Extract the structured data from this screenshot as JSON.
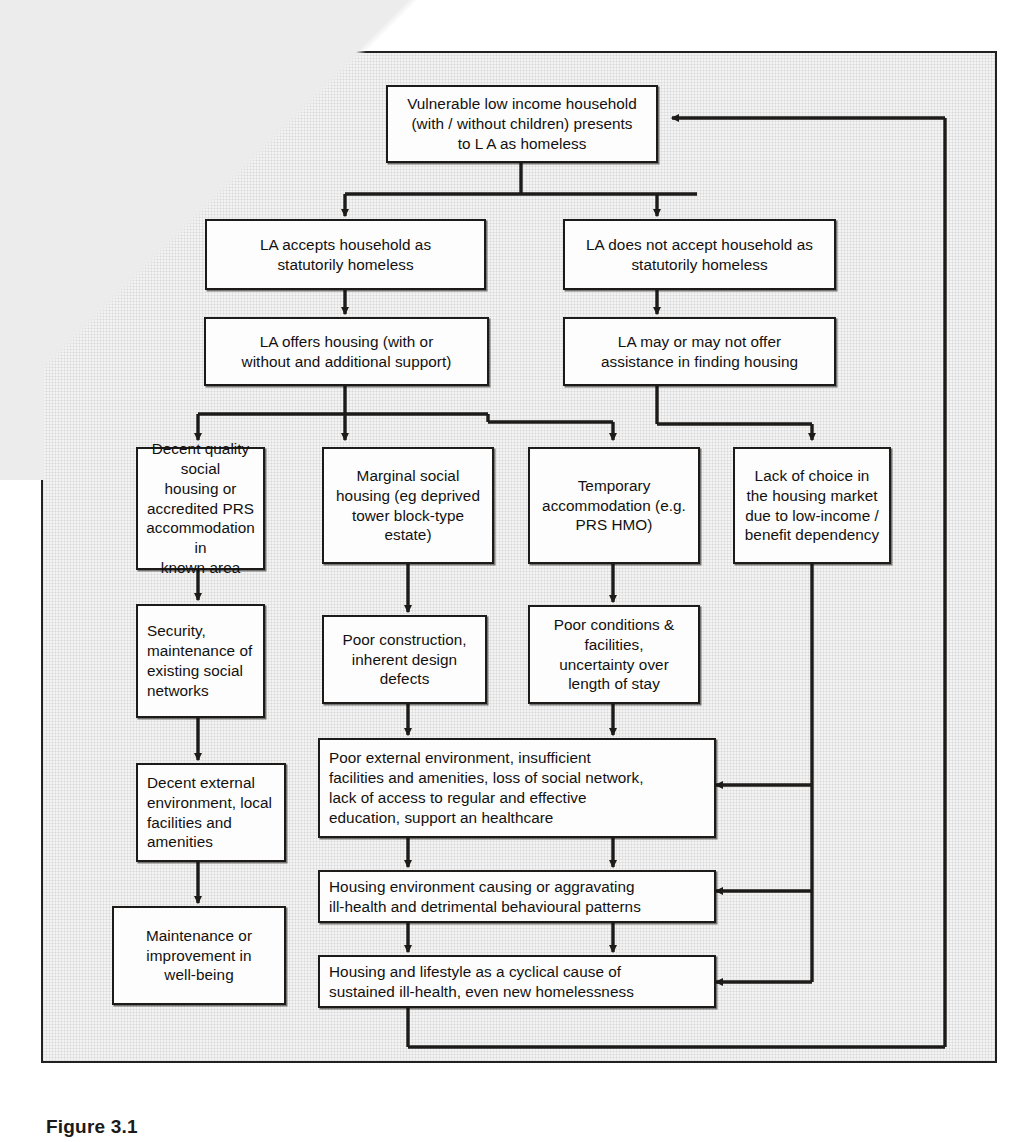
{
  "figure": {
    "caption": "Figure 3.1",
    "frame": {
      "border_color": "#23211f",
      "background": "#f3f3f3"
    },
    "line_color": "#1d1b19"
  },
  "nodes": {
    "start": {
      "id": "vulnerable-household",
      "lines": [
        "Vulnerable low income household",
        "(with / without children) presents",
        "to L A as homeless"
      ]
    },
    "accepted": {
      "id": "la-accepts",
      "lines": [
        "LA accepts household as",
        "statutorily homeless"
      ]
    },
    "not_accepted": {
      "id": "la-does-not-accept",
      "lines": [
        "LA does not accept household as",
        "statutorily homeless"
      ]
    },
    "offers_housing": {
      "id": "la-offers-housing",
      "lines": [
        "LA offers housing (with or",
        "without and additional support)"
      ]
    },
    "may_offer": {
      "id": "la-may-offer-assistance",
      "lines": [
        "LA may or may not offer",
        "assistance in finding housing"
      ]
    },
    "decent_quality": {
      "id": "decent-quality-social-housing",
      "lines": [
        "Decent quality social",
        "housing or",
        "accredited PRS",
        "accommodation in",
        "known area"
      ]
    },
    "marginal": {
      "id": "marginal-social-housing",
      "lines": [
        "Marginal social",
        "housing (eg deprived",
        "tower block-type",
        "estate)"
      ]
    },
    "temporary": {
      "id": "temporary-accommodation",
      "lines": [
        "Temporary",
        "accommodation (e.g.",
        "PRS HMO)"
      ]
    },
    "lack_of_choice": {
      "id": "lack-of-choice",
      "lines": [
        "Lack of choice in",
        "the housing market",
        "due to low-income /",
        "benefit dependency"
      ]
    },
    "security": {
      "id": "security-maintenance",
      "lines": [
        "Security,",
        "maintenance of",
        "existing social",
        "networks"
      ]
    },
    "poor_construction": {
      "id": "poor-construction",
      "lines": [
        "Poor construction,",
        "inherent design",
        "defects"
      ]
    },
    "poor_conditions": {
      "id": "poor-conditions",
      "lines": [
        "Poor conditions &",
        "facilities,",
        "uncertainty over",
        "length of stay"
      ]
    },
    "decent_external": {
      "id": "decent-external-environment",
      "lines": [
        "Decent external",
        "environment, local",
        "facilities and",
        "amenities"
      ]
    },
    "poor_external": {
      "id": "poor-external-environment",
      "lines": [
        "Poor external environment, insufficient",
        "facilities and amenities, loss of social network,",
        "lack of access to regular and effective",
        "education, support an healthcare"
      ]
    },
    "wellbeing": {
      "id": "maintenance-improvement-wellbeing",
      "lines": [
        "Maintenance or",
        "improvement in",
        "well-being"
      ]
    },
    "housing_env": {
      "id": "housing-environment-ill-health",
      "lines": [
        "Housing environment causing or aggravating",
        "ill-health and detrimental behavioural patterns"
      ]
    },
    "cyclical": {
      "id": "housing-lifestyle-cyclical-cause",
      "lines": [
        "Housing and lifestyle as a cyclical cause of",
        "sustained ill-health, even new homelessness"
      ]
    }
  },
  "edges": [
    {
      "from": "start",
      "to": "accepted"
    },
    {
      "from": "start",
      "to": "not_accepted"
    },
    {
      "from": "accepted",
      "to": "offers_housing"
    },
    {
      "from": "not_accepted",
      "to": "may_offer"
    },
    {
      "from": "offers_housing",
      "to": "decent_quality"
    },
    {
      "from": "offers_housing",
      "to": "marginal"
    },
    {
      "from": "offers_housing",
      "to": "temporary"
    },
    {
      "from": "may_offer",
      "to": "temporary"
    },
    {
      "from": "may_offer",
      "to": "lack_of_choice"
    },
    {
      "from": "decent_quality",
      "to": "security"
    },
    {
      "from": "marginal",
      "to": "poor_construction"
    },
    {
      "from": "temporary",
      "to": "poor_conditions"
    },
    {
      "from": "security",
      "to": "decent_external"
    },
    {
      "from": "decent_external",
      "to": "wellbeing"
    },
    {
      "from": "poor_construction",
      "to": "poor_external"
    },
    {
      "from": "poor_conditions",
      "to": "poor_external"
    },
    {
      "from": "poor_external",
      "to": "housing_env"
    },
    {
      "from": "housing_env",
      "to": "cyclical"
    },
    {
      "from": "lack_of_choice",
      "to": "poor_external"
    },
    {
      "from": "lack_of_choice",
      "to": "housing_env"
    },
    {
      "from": "lack_of_choice",
      "to": "cyclical"
    },
    {
      "from": "cyclical",
      "to": "start"
    }
  ]
}
